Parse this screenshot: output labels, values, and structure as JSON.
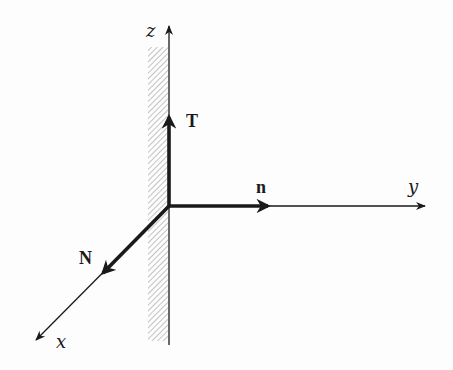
{
  "diagram": {
    "origin": {
      "x": 169,
      "y": 206
    },
    "wall": {
      "label": "",
      "hatched": true,
      "x": 148,
      "y": 47,
      "width": 20,
      "height": 294
    },
    "axes": [
      {
        "id": "z",
        "label": "z",
        "direction": "up"
      },
      {
        "id": "y",
        "label": "y",
        "direction": "right"
      },
      {
        "id": "x",
        "label": "x",
        "direction": "down-left"
      }
    ],
    "vectors": [
      {
        "id": "T",
        "label": "T",
        "along": "z"
      },
      {
        "id": "n",
        "label": "n",
        "along": "y"
      },
      {
        "id": "N",
        "label": "N",
        "along": "x"
      }
    ],
    "colors": {
      "ink": "#1a1a1a",
      "hatch": "#9a9a9a",
      "background": "#fdfdfd"
    }
  }
}
